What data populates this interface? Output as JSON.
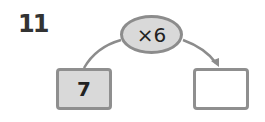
{
  "question_number": "11",
  "operation": "×6",
  "input_value": "7",
  "output_value": "",
  "colors": {
    "fill": "#d9d9d9",
    "border": "#8c8c8c",
    "arrow": "#8c8c8c"
  }
}
